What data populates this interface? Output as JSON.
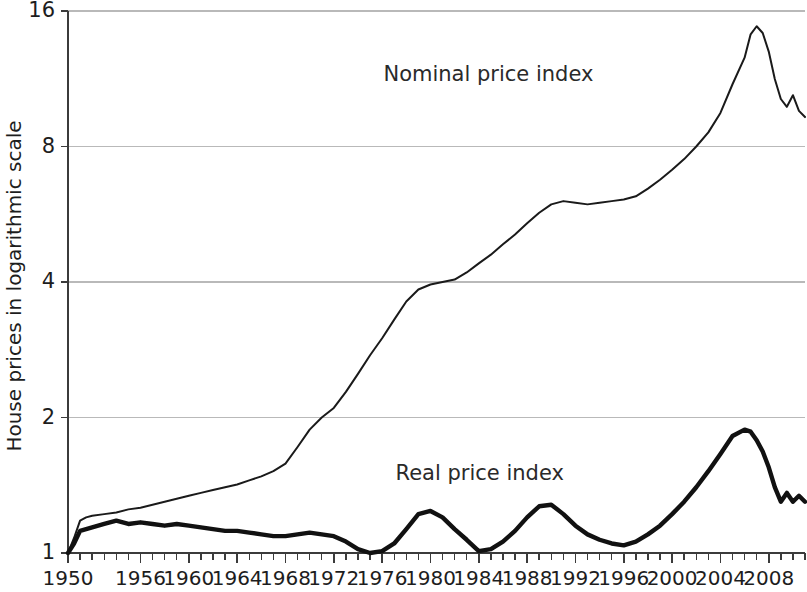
{
  "chart_data": {
    "type": "line",
    "title": "",
    "xlabel": "",
    "ylabel": "House prices in logarithmic scale",
    "yscale": "log2",
    "ylim": [
      1,
      16
    ],
    "xlim": [
      1950,
      2011
    ],
    "grid": true,
    "legend_position": "inline-annotations",
    "ytick_labels": [
      "16",
      "8",
      "4",
      "2",
      "1"
    ],
    "ytick_values": [
      16,
      8,
      4,
      2,
      1
    ],
    "xtick_labels": [
      "1950",
      "1956",
      "1960",
      "1964",
      "1968",
      "1972",
      "1976",
      "1980",
      "1984",
      "1988",
      "1992",
      "1996",
      "2000",
      "2004",
      "2008"
    ],
    "xtick_values": [
      1950,
      1956,
      1960,
      1964,
      1968,
      1972,
      1976,
      1980,
      1984,
      1988,
      1992,
      1996,
      2000,
      2004,
      2008
    ],
    "xtick_minor_step": 1,
    "annotations": [
      {
        "text": "Nominal price index",
        "x": 1992.0,
        "y": 11.2
      },
      {
        "text": "Real price index",
        "x": 1993.0,
        "y": 1.45
      }
    ],
    "series": [
      {
        "name": "Nominal price index",
        "color": "#1a1a1a",
        "x": [
          1950,
          1950.5,
          1951,
          1951.5,
          1952,
          1953,
          1954,
          1955,
          1956,
          1957,
          1958,
          1959,
          1960,
          1961,
          1962,
          1963,
          1964,
          1965,
          1966,
          1967,
          1968,
          1969,
          1970,
          1971,
          1972,
          1973,
          1974,
          1975,
          1976,
          1977,
          1978,
          1979,
          1980,
          1981,
          1982,
          1983,
          1984,
          1985,
          1986,
          1987,
          1988,
          1989,
          1990,
          1991,
          1992,
          1993,
          1994,
          1995,
          1996,
          1997,
          1998,
          1999,
          2000,
          2001,
          2002,
          2003,
          2004,
          2005,
          2006,
          2006.5,
          2007,
          2007.5,
          2008,
          2008.5,
          2009,
          2009.5,
          2010,
          2010.5,
          2011
        ],
        "values": [
          1.0,
          1.08,
          1.18,
          1.2,
          1.21,
          1.22,
          1.23,
          1.25,
          1.26,
          1.28,
          1.3,
          1.32,
          1.34,
          1.36,
          1.38,
          1.4,
          1.42,
          1.45,
          1.48,
          1.52,
          1.58,
          1.72,
          1.88,
          2.0,
          2.1,
          2.28,
          2.5,
          2.75,
          3.0,
          3.3,
          3.62,
          3.85,
          3.95,
          4.0,
          4.05,
          4.2,
          4.4,
          4.6,
          4.85,
          5.1,
          5.4,
          5.7,
          5.95,
          6.05,
          6.0,
          5.95,
          6.0,
          6.05,
          6.1,
          6.2,
          6.45,
          6.75,
          7.1,
          7.5,
          8.0,
          8.6,
          9.5,
          11.0,
          12.6,
          14.2,
          14.8,
          14.3,
          13.0,
          11.3,
          10.2,
          9.8,
          10.4,
          9.6,
          9.3
        ]
      },
      {
        "name": "Real price index",
        "color": "#111111",
        "x": [
          1950,
          1950.5,
          1951,
          1952,
          1953,
          1954,
          1955,
          1956,
          1957,
          1958,
          1959,
          1960,
          1961,
          1962,
          1963,
          1964,
          1965,
          1966,
          1967,
          1968,
          1969,
          1970,
          1971,
          1972,
          1973,
          1974,
          1975,
          1976,
          1977,
          1978,
          1979,
          1980,
          1981,
          1982,
          1983,
          1984,
          1985,
          1986,
          1987,
          1988,
          1989,
          1990,
          1991,
          1992,
          1993,
          1994,
          1995,
          1996,
          1997,
          1998,
          1999,
          2000,
          2001,
          2002,
          2003,
          2004,
          2005,
          2006,
          2006.5,
          2007,
          2007.5,
          2008,
          2008.5,
          2009,
          2009.5,
          2010,
          2010.5,
          2011
        ],
        "values": [
          1.0,
          1.05,
          1.12,
          1.14,
          1.16,
          1.18,
          1.16,
          1.17,
          1.16,
          1.15,
          1.16,
          1.15,
          1.14,
          1.13,
          1.12,
          1.12,
          1.11,
          1.1,
          1.09,
          1.09,
          1.1,
          1.11,
          1.1,
          1.09,
          1.06,
          1.02,
          1.0,
          1.01,
          1.05,
          1.13,
          1.22,
          1.24,
          1.2,
          1.13,
          1.07,
          1.01,
          1.02,
          1.06,
          1.12,
          1.2,
          1.27,
          1.28,
          1.22,
          1.15,
          1.1,
          1.07,
          1.05,
          1.04,
          1.06,
          1.1,
          1.15,
          1.22,
          1.3,
          1.4,
          1.52,
          1.66,
          1.82,
          1.88,
          1.86,
          1.78,
          1.68,
          1.55,
          1.4,
          1.3,
          1.36,
          1.3,
          1.34,
          1.3
        ]
      }
    ]
  },
  "axis": {
    "y_title": "House prices in logarithmic scale"
  }
}
